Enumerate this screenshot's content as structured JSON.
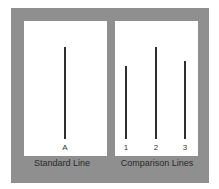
{
  "standard": {
    "caption": "Standard Line",
    "lines": [
      {
        "label": "A",
        "length": 92
      }
    ]
  },
  "comparison": {
    "caption": "Comparison Lines",
    "lines": [
      {
        "label": "1",
        "length": 73
      },
      {
        "label": "2",
        "length": 92
      },
      {
        "label": "3",
        "length": 78
      }
    ]
  },
  "colors": {
    "frame": "#8f8f8f",
    "panel": "#ffffff",
    "line": "#2e2e2e"
  }
}
